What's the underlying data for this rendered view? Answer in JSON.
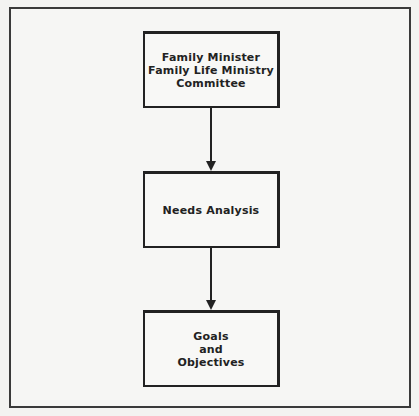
{
  "diagram": {
    "type": "flowchart",
    "direction": "top-to-bottom",
    "nodes": [
      {
        "id": "box1",
        "lines": [
          "Family Minister",
          "Family Life Ministry",
          "Committee"
        ]
      },
      {
        "id": "box2",
        "lines": [
          "Needs Analysis"
        ]
      },
      {
        "id": "box3",
        "lines": [
          "Goals",
          "and",
          "Objectives"
        ]
      }
    ],
    "edges": [
      {
        "from": "box1",
        "to": "box2"
      },
      {
        "from": "box2",
        "to": "box3"
      }
    ]
  }
}
